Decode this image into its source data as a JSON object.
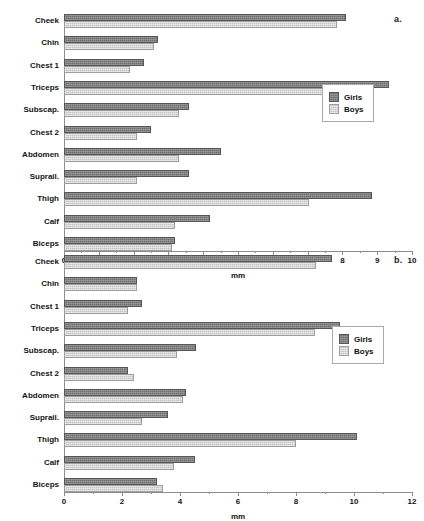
{
  "figure": {
    "panel_a_label": "a.",
    "panel_b_label": "b."
  },
  "colors": {
    "girls": "#6f6f6f",
    "boys": "#c3c3c3",
    "axis": "#8d8d8d",
    "text": "#131313",
    "background": "#ffffff"
  },
  "legend": {
    "girls_label": "Girls",
    "boys_label": "Boys"
  },
  "chart_data": [
    {
      "type": "bar",
      "orientation": "horizontal",
      "panel": "a",
      "title": "",
      "xlabel": "mm",
      "ylabel": "",
      "xlim": [
        0,
        10
      ],
      "xticks": [
        0,
        1,
        2,
        3,
        4,
        5,
        6,
        7,
        8,
        9,
        10
      ],
      "xticklabels": [
        "0",
        "1",
        "2",
        "3",
        "4",
        "5",
        "6",
        "7",
        "8",
        "9",
        "10"
      ],
      "minor_tick_step": 0.5,
      "grid": false,
      "legend_position": "center-right",
      "categories": [
        "Cheek",
        "Chin",
        "Chest 1",
        "Triceps",
        "Subscap.",
        "Chest 2",
        "Abdomen",
        "Suprail.",
        "Thigh",
        "Calf",
        "Biceps"
      ],
      "series": [
        {
          "name": "Girls",
          "color": "#6f6f6f",
          "values": [
            8.1,
            2.7,
            2.3,
            9.35,
            3.6,
            2.5,
            4.5,
            3.6,
            8.85,
            4.2,
            3.2
          ]
        },
        {
          "name": "Boys",
          "color": "#c3c3c3",
          "values": [
            7.85,
            2.6,
            1.9,
            7.8,
            3.3,
            2.1,
            3.3,
            2.1,
            7.05,
            3.2,
            3.1
          ]
        }
      ]
    },
    {
      "type": "bar",
      "orientation": "horizontal",
      "panel": "b",
      "title": "",
      "xlabel": "mm",
      "ylabel": "",
      "xlim": [
        0,
        12
      ],
      "xticks": [
        0,
        2,
        4,
        6,
        8,
        10,
        12
      ],
      "xticklabels": [
        "0",
        "2",
        "4",
        "6",
        "8",
        "10",
        "12"
      ],
      "minor_tick_step": 1,
      "grid": false,
      "legend_position": "center-right",
      "categories": [
        "Cheek",
        "Chin",
        "Chest 1",
        "Triceps",
        "Subscap.",
        "Chest 2",
        "Abdomen",
        "Suprail.",
        "Thigh",
        "Calf",
        "Biceps"
      ],
      "series": [
        {
          "name": "Girls",
          "color": "#6f6f6f",
          "values": [
            9.25,
            2.5,
            2.7,
            9.5,
            4.55,
            2.2,
            4.2,
            3.6,
            10.1,
            4.5,
            3.2
          ]
        },
        {
          "name": "Boys",
          "color": "#c3c3c3",
          "values": [
            8.7,
            2.5,
            2.2,
            8.65,
            3.9,
            2.4,
            4.1,
            2.7,
            8.0,
            3.8,
            3.4
          ]
        }
      ]
    }
  ]
}
